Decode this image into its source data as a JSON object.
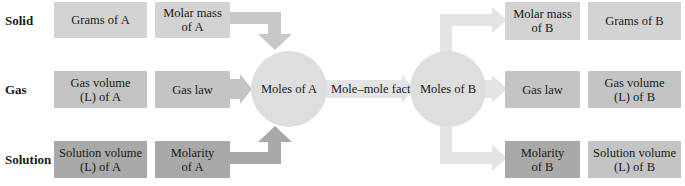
{
  "rows": [
    {
      "label": "Solid"
    },
    {
      "label": "Gas"
    },
    {
      "label": "Solution"
    }
  ],
  "left_boxes": {
    "solid": {
      "quantity": "Grams of A",
      "factor_line1": "Molar mass",
      "factor_line2": "of A"
    },
    "gas": {
      "quantity_line1": "Gas volume",
      "quantity_line2": "(L) of A",
      "factor": "Gas law"
    },
    "solution": {
      "quantity_line1": "Solution volume",
      "quantity_line2": "(L) of A",
      "factor_line1": "Molarity",
      "factor_line2": "of A"
    }
  },
  "center": {
    "moles_a": "Moles of A",
    "conversion": "Mole–mole factor",
    "moles_b": "Moles of B"
  },
  "right_boxes": {
    "solid": {
      "factor_line1": "Molar mass",
      "factor_line2": "of B",
      "quantity": "Grams of B"
    },
    "gas": {
      "factor": "Gas law",
      "quantity_line1": "Gas volume",
      "quantity_line2": "(L) of B"
    },
    "solution": {
      "factor_line1": "Molarity",
      "factor_line2": "of B",
      "quantity_line1": "Solution volume",
      "quantity_line2": "(L) of B"
    }
  },
  "colors": {
    "solid_box": "#d3d3d3",
    "gas_box": "#c4c4c4",
    "solution_box": "#a9a9a9",
    "circle": "#dedede",
    "arrow_left_solid": "#c8c8c8",
    "arrow_left_gas": "#c4c4c4",
    "arrow_left_solution": "#a9a9a9",
    "arrow_right": "#e4e4e4"
  }
}
